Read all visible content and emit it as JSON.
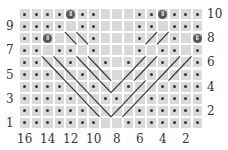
{
  "chart": {
    "type": "knitting-chart",
    "columns": 16,
    "rows": 10,
    "column_labels": [
      "16",
      "14",
      "12",
      "10",
      "8",
      "6",
      "4",
      "2"
    ],
    "row_labels_left": [
      "9",
      "7",
      "5",
      "3",
      "1"
    ],
    "row_labels_right": [
      "10",
      "8",
      "6",
      "4",
      "2"
    ],
    "colors": {
      "cell": "#d9d9d9",
      "grid_line": "#ffffff",
      "dot": "#333333",
      "bobble": "#555555",
      "cable_line": "#333333"
    },
    "legend_symbols": {
      "dot": "purl",
      "bobble": "bobble (MB)",
      "blank": "knit",
      "cable": "cable cross"
    },
    "grid": [
      "DDDDBDD...DDBDDD",
      "DDDD.DD...DD.DDD",
      "DDB.XXD...DXXD.BD",
      "DD.DD.D...D.DD.DD",
      "DDXXDXXD.DXXDXXD",
      "DDDXXDXX.XXDXXDDD",
      "DDDDXXDXXDXXDDDD",
      "DDDDDXXDDXXDDDDD",
      "DDDDDDXXXXDDDDDD",
      "DDDDDDD..DDDDDDD"
    ]
  }
}
